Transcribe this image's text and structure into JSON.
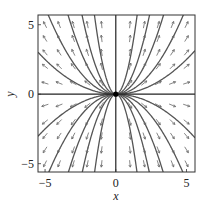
{
  "chart_data": {
    "type": "phase_portrait",
    "title": "",
    "xlabel": "x",
    "ylabel": "y",
    "xlim": [
      -5.5,
      5.6
    ],
    "ylim": [
      -5.6,
      5.7
    ],
    "xticks": [
      -5,
      0,
      5
    ],
    "xtick_labels": [
      "−5",
      "0",
      "5"
    ],
    "yticks": [
      -5,
      0,
      5
    ],
    "ytick_labels": [
      "−5",
      "0",
      "5"
    ],
    "grid": false,
    "legend": null,
    "system": {
      "dx": "x",
      "dy": "2y",
      "description": "Unstable node at origin; trajectories y = C·x²"
    },
    "equilibrium": {
      "x": 0,
      "y": 0
    },
    "trajectories": {
      "family": "y = C x^2",
      "C_values": [
        0.1,
        0.25,
        0.5,
        1.0,
        2.5,
        -0.1,
        -0.25,
        -0.5,
        -1.0,
        -2.5
      ],
      "axes_trajectories": [
        "x-axis (y=0)",
        "y-axis (x=0)"
      ]
    },
    "arrow_grid": {
      "x": [
        -5,
        -4,
        -3,
        -2,
        -1,
        1,
        2,
        3,
        4,
        5
      ],
      "y": [
        -5,
        -4,
        -3,
        -2,
        -0.8,
        0.8,
        2,
        3,
        4,
        5
      ]
    }
  }
}
